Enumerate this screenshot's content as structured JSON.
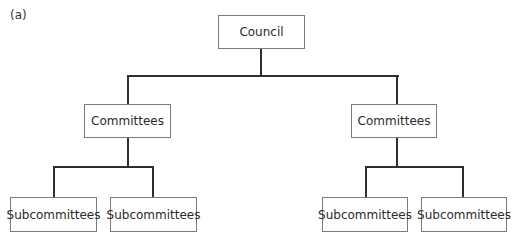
{
  "diagram": {
    "panel_label": "(a)",
    "root": {
      "label": "Council"
    },
    "committees": [
      {
        "label": "Committees",
        "subcommittees": [
          {
            "label": "Subcommittees"
          },
          {
            "label": "Subcommittees"
          }
        ]
      },
      {
        "label": "Committees",
        "subcommittees": [
          {
            "label": "Subcommittees"
          },
          {
            "label": "Subcommittees"
          }
        ]
      }
    ],
    "colors": {
      "line": "#2e2e2e",
      "box_border": "#7a7a7a",
      "text": "#2a2a2a"
    }
  }
}
